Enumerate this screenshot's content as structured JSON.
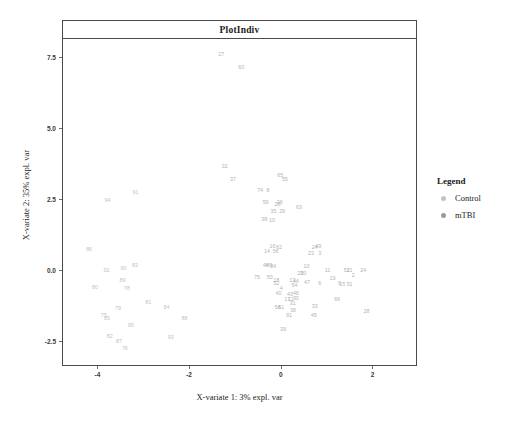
{
  "chart_data": {
    "type": "scatter",
    "title": "PlotIndiv",
    "xlabel": "X-variate 1: 3% expl. var",
    "ylabel": "X-variate 2: 35% expl. var",
    "xlim": [
      -4.75,
      2.95
    ],
    "ylim": [
      -3.35,
      8.15
    ],
    "xticks": [
      "-4",
      "-2",
      "0",
      "2"
    ],
    "xtick_values": [
      -4,
      -2,
      0,
      2
    ],
    "yticks": [
      "7.5",
      "5.0",
      "2.5",
      "0.0",
      "-2.5"
    ],
    "ytick_values": [
      7.5,
      5.0,
      2.5,
      0.0,
      -2.5
    ],
    "grid": false,
    "legend": {
      "title": "Legend",
      "position": "right",
      "entries": [
        {
          "label": "Control",
          "color": "#c3c3c3"
        },
        {
          "label": "mTBI",
          "color": "#9a9a9a"
        }
      ]
    },
    "point_label_mode": "sample-number",
    "series": [
      {
        "name": "Control",
        "color": "#c3c3c3",
        "points": [
          {
            "label": "91",
            "x": -3.17,
            "y": 2.7
          },
          {
            "label": "94",
            "x": -3.78,
            "y": 2.45
          },
          {
            "label": "86",
            "x": -4.18,
            "y": 0.72
          },
          {
            "label": "83",
            "x": -3.18,
            "y": 0.13
          },
          {
            "label": "90",
            "x": -3.43,
            "y": 0.02
          },
          {
            "label": "92",
            "x": -3.8,
            "y": -0.02
          },
          {
            "label": "89",
            "x": -3.45,
            "y": -0.38
          },
          {
            "label": "80",
            "x": -4.05,
            "y": -0.62
          },
          {
            "label": "78",
            "x": -3.36,
            "y": -0.68
          },
          {
            "label": "81",
            "x": -2.89,
            "y": -1.18
          },
          {
            "label": "84",
            "x": -2.49,
            "y": -1.33
          },
          {
            "label": "79",
            "x": -3.55,
            "y": -1.37
          },
          {
            "label": "75",
            "x": -3.86,
            "y": -1.62
          },
          {
            "label": "85",
            "x": -3.79,
            "y": -1.72
          },
          {
            "label": "88",
            "x": -2.1,
            "y": -1.72
          },
          {
            "label": "95",
            "x": -3.27,
            "y": -1.98
          },
          {
            "label": "82",
            "x": -3.73,
            "y": -2.37
          },
          {
            "label": "93",
            "x": -2.4,
            "y": -2.38
          },
          {
            "label": "87",
            "x": -3.53,
            "y": -2.55
          },
          {
            "label": "76",
            "x": -3.4,
            "y": -2.78
          }
        ]
      },
      {
        "name": "mTBI",
        "color": "#b4b4b4",
        "points": [
          {
            "label": "27",
            "x": -1.3,
            "y": 7.58
          },
          {
            "label": "60",
            "x": -0.86,
            "y": 7.12
          },
          {
            "label": "32",
            "x": -1.22,
            "y": 3.63
          },
          {
            "label": "37",
            "x": -1.04,
            "y": 3.19
          },
          {
            "label": "65",
            "x": -0.01,
            "y": 3.33
          },
          {
            "label": "55",
            "x": 0.09,
            "y": 3.16
          },
          {
            "label": "74",
            "x": -0.45,
            "y": 2.8
          },
          {
            "label": "8",
            "x": -0.28,
            "y": 2.8
          },
          {
            "label": "59",
            "x": -0.33,
            "y": 2.35
          },
          {
            "label": "26",
            "x": -0.02,
            "y": 2.38
          },
          {
            "label": "28",
            "x": -0.07,
            "y": 2.29
          },
          {
            "label": "63",
            "x": 0.4,
            "y": 2.18
          },
          {
            "label": "35",
            "x": -0.16,
            "y": 2.05
          },
          {
            "label": "29",
            "x": 0.03,
            "y": 2.05
          },
          {
            "label": "38",
            "x": -0.36,
            "y": 1.75
          },
          {
            "label": "10",
            "x": -0.19,
            "y": 1.73
          },
          {
            "label": "16",
            "x": -0.18,
            "y": 0.8
          },
          {
            "label": "62",
            "x": -0.04,
            "y": 0.78
          },
          {
            "label": "24",
            "x": 0.74,
            "y": 0.78
          },
          {
            "label": "49",
            "x": 0.82,
            "y": 0.8
          },
          {
            "label": "14",
            "x": -0.3,
            "y": 0.65
          },
          {
            "label": "56",
            "x": -0.11,
            "y": 0.62
          },
          {
            "label": "23",
            "x": 0.66,
            "y": 0.58
          },
          {
            "label": "3",
            "x": 0.85,
            "y": 0.57
          },
          {
            "label": "48",
            "x": -0.33,
            "y": 0.14
          },
          {
            "label": "49",
            "x": -0.25,
            "y": 0.14
          },
          {
            "label": "34",
            "x": -0.17,
            "y": 0.12
          },
          {
            "label": "10",
            "x": 0.56,
            "y": 0.11
          },
          {
            "label": "11",
            "x": 1.02,
            "y": -0.05
          },
          {
            "label": "51",
            "x": 1.44,
            "y": -0.04
          },
          {
            "label": "21",
            "x": 1.5,
            "y": -0.05
          },
          {
            "label": "24",
            "x": 1.8,
            "y": -0.04
          },
          {
            "label": "25",
            "x": 0.43,
            "y": -0.14
          },
          {
            "label": "20",
            "x": 0.49,
            "y": -0.14
          },
          {
            "label": "75",
            "x": -0.52,
            "y": -0.27
          },
          {
            "label": "50",
            "x": -0.24,
            "y": -0.28
          },
          {
            "label": "2",
            "x": 1.58,
            "y": -0.22
          },
          {
            "label": "19",
            "x": 1.13,
            "y": -0.33
          },
          {
            "label": "18",
            "x": -0.1,
            "y": -0.4
          },
          {
            "label": "52",
            "x": -0.1,
            "y": -0.5
          },
          {
            "label": "13",
            "x": 0.25,
            "y": -0.4
          },
          {
            "label": "44",
            "x": 0.33,
            "y": -0.41
          },
          {
            "label": "47",
            "x": 0.57,
            "y": -0.45
          },
          {
            "label": "6",
            "x": 0.85,
            "y": -0.48
          },
          {
            "label": "9",
            "x": 1.28,
            "y": -0.5
          },
          {
            "label": "15",
            "x": 1.34,
            "y": -0.52
          },
          {
            "label": "5",
            "x": 1.47,
            "y": -0.52
          },
          {
            "label": "1",
            "x": 1.53,
            "y": -0.52
          },
          {
            "label": "54",
            "x": 0.3,
            "y": -0.55
          },
          {
            "label": "4",
            "x": 0.01,
            "y": -0.67
          },
          {
            "label": "40",
            "x": -0.05,
            "y": -0.86
          },
          {
            "label": "43",
            "x": 0.2,
            "y": -0.88
          },
          {
            "label": "46",
            "x": 0.33,
            "y": -0.86
          },
          {
            "label": "17",
            "x": 0.14,
            "y": -1.04
          },
          {
            "label": "12",
            "x": 0.22,
            "y": -1.04
          },
          {
            "label": "30",
            "x": 0.33,
            "y": -1.01
          },
          {
            "label": "66",
            "x": 1.23,
            "y": -1.07
          },
          {
            "label": "31",
            "x": 0.26,
            "y": -1.21
          },
          {
            "label": "58",
            "x": -0.07,
            "y": -1.33
          },
          {
            "label": "61",
            "x": 0.01,
            "y": -1.35
          },
          {
            "label": "33",
            "x": 0.74,
            "y": -1.32
          },
          {
            "label": "36",
            "x": 0.27,
            "y": -1.44
          },
          {
            "label": "28",
            "x": 1.87,
            "y": -1.47
          },
          {
            "label": "45",
            "x": 0.72,
            "y": -1.62
          },
          {
            "label": "91",
            "x": 0.18,
            "y": -1.62
          },
          {
            "label": "39",
            "x": 0.05,
            "y": -2.12
          }
        ]
      }
    ]
  }
}
